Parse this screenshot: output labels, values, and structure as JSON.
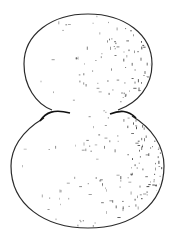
{
  "image": {
    "description": "Stippled pen-and-ink drawing of two stacked spheres forming a figure-eight shape, shading concentrated on the right side",
    "background": "#ffffff",
    "ink": "#2a2a2a",
    "shapes": [
      {
        "name": "top-sphere",
        "cx": 88,
        "cy": 64,
        "rx": 64,
        "ry": 50
      },
      {
        "name": "bottom-sphere",
        "cx": 87.5,
        "cy": 166,
        "rx": 76.5,
        "ry": 62
      }
    ]
  }
}
